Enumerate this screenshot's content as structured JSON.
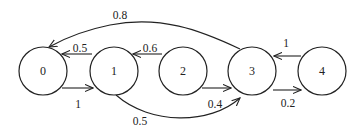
{
  "diagram": {
    "type": "state-transition-graph",
    "nodes": [
      {
        "id": "0",
        "label": "0"
      },
      {
        "id": "1",
        "label": "1"
      },
      {
        "id": "2",
        "label": "2"
      },
      {
        "id": "3",
        "label": "3"
      },
      {
        "id": "4",
        "label": "4"
      }
    ],
    "edges": [
      {
        "from": "1",
        "to": "0",
        "label": "0.5"
      },
      {
        "from": "0",
        "to": "1",
        "label": "1"
      },
      {
        "from": "2",
        "to": "1",
        "label": "0.6"
      },
      {
        "from": "2",
        "to": "3",
        "label": "0.4"
      },
      {
        "from": "1",
        "to": "3",
        "label": "0.5"
      },
      {
        "from": "3",
        "to": "0",
        "label": "0.8"
      },
      {
        "from": "4",
        "to": "3",
        "label": "1"
      },
      {
        "from": "3",
        "to": "4",
        "label": "0.2"
      }
    ],
    "colors": {
      "stroke": "#222222",
      "background": "#ffffff"
    }
  }
}
